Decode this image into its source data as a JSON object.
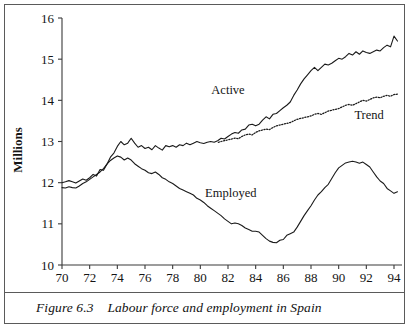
{
  "figure": {
    "caption_prefix": "Figure 6.3",
    "caption_text": "Labour force and employment in Spain",
    "caption_full": "Figure 6.3    Labour force and employment in Spain"
  },
  "chart_data": {
    "type": "line",
    "title": "Labour force and employment in Spain",
    "xlabel": "",
    "ylabel": "Millions",
    "xlim": [
      70,
      94.5
    ],
    "ylim": [
      10,
      16
    ],
    "ytick_labels": [
      "10",
      "11",
      "12",
      "13",
      "14",
      "15",
      "16"
    ],
    "ytick_values": [
      10,
      11,
      12,
      13,
      14,
      15,
      16
    ],
    "xtick_labels": [
      "70",
      "72",
      "74",
      "76",
      "78",
      "80",
      "82",
      "84",
      "86",
      "88",
      "90",
      "92",
      "94"
    ],
    "xtick_values": [
      70,
      72,
      74,
      76,
      78,
      80,
      82,
      84,
      86,
      88,
      90,
      92,
      94
    ],
    "grid": false,
    "legend_position": "inline-annotations",
    "annotations": [
      {
        "label": "Active",
        "x": 82.0,
        "y": 14.15
      },
      {
        "label": "Trend",
        "x": 92.2,
        "y": 13.55
      },
      {
        "label": "Employed",
        "x": 82.2,
        "y": 11.65
      }
    ],
    "series": [
      {
        "name": "Active",
        "style": "solid",
        "color": "#1a1a1a",
        "x": [
          70.0,
          70.25,
          70.5,
          70.75,
          71.0,
          71.25,
          71.5,
          71.75,
          72.0,
          72.25,
          72.5,
          72.75,
          73.0,
          73.25,
          73.5,
          73.75,
          74.0,
          74.25,
          74.5,
          74.75,
          75.0,
          75.25,
          75.5,
          75.75,
          76.0,
          76.25,
          76.5,
          76.75,
          77.0,
          77.25,
          77.5,
          77.75,
          78.0,
          78.25,
          78.5,
          78.75,
          79.0,
          79.25,
          79.5,
          79.75,
          80.0,
          80.25,
          80.5,
          80.75,
          81.0,
          81.25,
          81.5,
          81.75,
          82.0,
          82.25,
          82.5,
          82.75,
          83.0,
          83.25,
          83.5,
          83.75,
          84.0,
          84.25,
          84.5,
          84.75,
          85.0,
          85.25,
          85.5,
          85.75,
          86.0,
          86.25,
          86.5,
          86.75,
          87.0,
          87.25,
          87.5,
          87.75,
          88.0,
          88.25,
          88.5,
          88.75,
          89.0,
          89.25,
          89.5,
          89.75,
          90.0,
          90.25,
          90.5,
          90.75,
          91.0,
          91.25,
          91.5,
          91.75,
          92.0,
          92.25,
          92.5,
          92.75,
          93.0,
          93.25,
          93.5,
          93.75,
          94.0,
          94.25
        ],
        "y": [
          12.0,
          12.02,
          12.05,
          12.02,
          11.99,
          12.04,
          12.09,
          12.06,
          12.12,
          12.2,
          12.16,
          12.32,
          12.3,
          12.45,
          12.62,
          12.72,
          12.88,
          13.0,
          12.92,
          12.96,
          13.08,
          12.96,
          12.86,
          12.9,
          12.83,
          12.86,
          12.8,
          12.9,
          12.84,
          12.79,
          12.9,
          12.87,
          12.9,
          12.86,
          12.92,
          12.9,
          12.96,
          12.92,
          12.96,
          13.0,
          12.97,
          12.95,
          12.98,
          13.0,
          12.98,
          13.02,
          13.08,
          13.06,
          13.12,
          13.18,
          13.22,
          13.2,
          13.28,
          13.3,
          13.4,
          13.42,
          13.38,
          13.42,
          13.52,
          13.6,
          13.55,
          13.66,
          13.68,
          13.75,
          13.82,
          13.88,
          13.96,
          14.12,
          14.25,
          14.4,
          14.52,
          14.62,
          14.72,
          14.8,
          14.72,
          14.8,
          14.88,
          14.86,
          14.9,
          14.96,
          15.02,
          15.0,
          15.06,
          15.14,
          15.1,
          15.18,
          15.12,
          15.2,
          15.16,
          15.14,
          15.18,
          15.22,
          15.2,
          15.28,
          15.34,
          15.3,
          15.56,
          15.44
        ]
      },
      {
        "name": "Employed",
        "style": "solid",
        "color": "#1a1a1a",
        "x": [
          70.0,
          70.25,
          70.5,
          70.75,
          71.0,
          71.25,
          71.5,
          71.75,
          72.0,
          72.25,
          72.5,
          72.75,
          73.0,
          73.25,
          73.5,
          73.75,
          74.0,
          74.25,
          74.5,
          74.75,
          75.0,
          75.25,
          75.5,
          75.75,
          76.0,
          76.25,
          76.5,
          76.75,
          77.0,
          77.25,
          77.5,
          77.75,
          78.0,
          78.25,
          78.5,
          78.75,
          79.0,
          79.25,
          79.5,
          79.75,
          80.0,
          80.25,
          80.5,
          80.75,
          81.0,
          81.25,
          81.5,
          81.75,
          82.0,
          82.25,
          82.5,
          82.75,
          83.0,
          83.25,
          83.5,
          83.75,
          84.0,
          84.25,
          84.5,
          84.75,
          85.0,
          85.25,
          85.5,
          85.75,
          86.0,
          86.25,
          86.5,
          86.75,
          87.0,
          87.25,
          87.5,
          87.75,
          88.0,
          88.25,
          88.5,
          88.75,
          89.0,
          89.25,
          89.5,
          89.75,
          90.0,
          90.25,
          90.5,
          90.75,
          91.0,
          91.25,
          91.5,
          91.75,
          92.0,
          92.25,
          92.5,
          92.75,
          93.0,
          93.25,
          93.5,
          93.75,
          94.0,
          94.25
        ],
        "y": [
          11.88,
          11.87,
          11.9,
          11.88,
          11.87,
          11.92,
          11.98,
          12.02,
          12.08,
          12.14,
          12.2,
          12.26,
          12.34,
          12.45,
          12.54,
          12.6,
          12.65,
          12.62,
          12.55,
          12.6,
          12.55,
          12.46,
          12.4,
          12.34,
          12.3,
          12.24,
          12.22,
          12.26,
          12.2,
          12.12,
          12.08,
          12.02,
          11.98,
          11.92,
          11.86,
          11.82,
          11.78,
          11.74,
          11.7,
          11.62,
          11.58,
          11.52,
          11.44,
          11.38,
          11.32,
          11.26,
          11.2,
          11.12,
          11.06,
          11.0,
          11.02,
          11.0,
          10.96,
          10.9,
          10.86,
          10.82,
          10.82,
          10.8,
          10.72,
          10.64,
          10.58,
          10.55,
          10.54,
          10.6,
          10.62,
          10.72,
          10.76,
          10.8,
          10.92,
          11.06,
          11.2,
          11.32,
          11.44,
          11.58,
          11.7,
          11.78,
          11.88,
          11.96,
          12.1,
          12.24,
          12.36,
          12.42,
          12.48,
          12.5,
          12.52,
          12.5,
          12.47,
          12.5,
          12.44,
          12.38,
          12.26,
          12.14,
          12.04,
          11.98,
          11.86,
          11.8,
          11.74,
          11.78
        ]
      },
      {
        "name": "Trend",
        "style": "dotted",
        "color": "#1a1a1a",
        "x": [
          81.3,
          81.5,
          81.75,
          82.0,
          82.25,
          82.5,
          82.75,
          83.0,
          83.25,
          83.5,
          83.75,
          84.0,
          84.25,
          84.5,
          84.75,
          85.0,
          85.25,
          85.5,
          85.75,
          86.0,
          86.25,
          86.5,
          86.75,
          87.0,
          87.25,
          87.5,
          87.75,
          88.0,
          88.25,
          88.5,
          88.75,
          89.0,
          89.25,
          89.5,
          89.75,
          90.0,
          90.25,
          90.5,
          90.75,
          91.0,
          91.25,
          91.5,
          91.75,
          92.0,
          92.25,
          92.5,
          92.75,
          93.0,
          93.25,
          93.5,
          93.75,
          94.0,
          94.25
        ],
        "y": [
          12.98,
          13.0,
          13.02,
          13.04,
          13.06,
          13.08,
          13.07,
          13.12,
          13.16,
          13.18,
          13.16,
          13.22,
          13.26,
          13.28,
          13.3,
          13.29,
          13.34,
          13.38,
          13.4,
          13.42,
          13.44,
          13.46,
          13.5,
          13.54,
          13.56,
          13.58,
          13.6,
          13.62,
          13.66,
          13.68,
          13.66,
          13.7,
          13.74,
          13.76,
          13.78,
          13.8,
          13.84,
          13.88,
          13.9,
          13.88,
          13.92,
          13.96,
          14.0,
          13.98,
          14.02,
          14.06,
          14.08,
          14.06,
          14.1,
          14.12,
          14.1,
          14.14,
          14.15
        ]
      }
    ]
  }
}
